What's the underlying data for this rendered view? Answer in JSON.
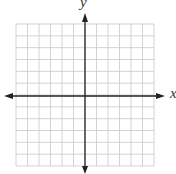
{
  "diagram": {
    "type": "coordinate-plane",
    "x_axis_label": "x",
    "y_axis_label": "y",
    "grid": {
      "columns": 12,
      "rows": 12,
      "left": 16,
      "top": 24,
      "right": 154,
      "bottom": 166
    },
    "origin": {
      "x": 85,
      "y": 96
    },
    "colors": {
      "grid": "#c8c8c8",
      "axis": "#222222"
    }
  }
}
